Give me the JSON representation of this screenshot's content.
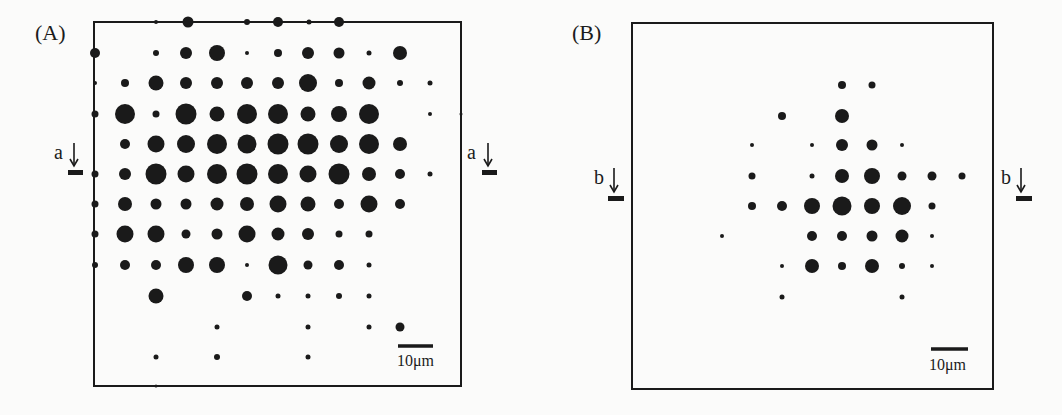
{
  "colors": {
    "ink": "#1a1a1a",
    "background": "#fbfbfa"
  },
  "panels": [
    {
      "id": "A",
      "label": "(A)",
      "label_pos": [
        35,
        40
      ],
      "frame": {
        "x": 94,
        "y": 22,
        "w": 367,
        "h": 364
      },
      "section_markers": [
        {
          "text": "a",
          "text_pos": [
            54,
            159
          ],
          "arrow_x": 74,
          "arrow_top": 143,
          "arrow_bottom": 166,
          "bar": [
            68,
            170,
            15,
            5
          ]
        },
        {
          "text": "a",
          "text_pos": [
            467,
            159
          ],
          "arrow_x": 488,
          "arrow_top": 143,
          "arrow_bottom": 166,
          "bar": [
            482,
            170,
            15,
            5
          ]
        }
      ],
      "scale_bar": {
        "x1": 398,
        "x2": 433,
        "y": 346,
        "label": "10μm",
        "label_pos": [
          397,
          366
        ]
      },
      "dots": [
        [
          156,
          22,
          2
        ],
        [
          188,
          22,
          5.5
        ],
        [
          247,
          22,
          3
        ],
        [
          278,
          22,
          5
        ],
        [
          309,
          22,
          2.5
        ],
        [
          339,
          22,
          5
        ],
        [
          95,
          53,
          5
        ],
        [
          156,
          53,
          3
        ],
        [
          186,
          53,
          6
        ],
        [
          217,
          53,
          8
        ],
        [
          247,
          53,
          2
        ],
        [
          278,
          53,
          4
        ],
        [
          308,
          53,
          6
        ],
        [
          339,
          53,
          5.5
        ],
        [
          369,
          53,
          2.5
        ],
        [
          400,
          53,
          7
        ],
        [
          95,
          83,
          2
        ],
        [
          125,
          83,
          4
        ],
        [
          156,
          83,
          7.5
        ],
        [
          186,
          83,
          6
        ],
        [
          217,
          83,
          6
        ],
        [
          247,
          83,
          6
        ],
        [
          278,
          83,
          6
        ],
        [
          308,
          83,
          9
        ],
        [
          339,
          83,
          4
        ],
        [
          369,
          83,
          6.5
        ],
        [
          400,
          83,
          3
        ],
        [
          430,
          83,
          2.5
        ],
        [
          95,
          114,
          3.5
        ],
        [
          125,
          114,
          10
        ],
        [
          156,
          114,
          3.5
        ],
        [
          186,
          114,
          10.5
        ],
        [
          217,
          114,
          7.5
        ],
        [
          247,
          114,
          10
        ],
        [
          278,
          114,
          10
        ],
        [
          308,
          114,
          7.5
        ],
        [
          339,
          114,
          8
        ],
        [
          369,
          114,
          10
        ],
        [
          430,
          114,
          2
        ],
        [
          461,
          114,
          1.5
        ],
        [
          125,
          144,
          5
        ],
        [
          156,
          144,
          8.5
        ],
        [
          186,
          144,
          9
        ],
        [
          217,
          144,
          10
        ],
        [
          247,
          144,
          9.5
        ],
        [
          278,
          144,
          10.5
        ],
        [
          308,
          144,
          10.5
        ],
        [
          339,
          144,
          9
        ],
        [
          369,
          144,
          10
        ],
        [
          400,
          144,
          7
        ],
        [
          95,
          174,
          3.5
        ],
        [
          125,
          174,
          6
        ],
        [
          156,
          174,
          10.5
        ],
        [
          186,
          174,
          8.5
        ],
        [
          217,
          174,
          10
        ],
        [
          247,
          174,
          10.5
        ],
        [
          278,
          174,
          10
        ],
        [
          308,
          174,
          8.5
        ],
        [
          339,
          174,
          10.5
        ],
        [
          369,
          174,
          7
        ],
        [
          400,
          174,
          5
        ],
        [
          430,
          174,
          2.5
        ],
        [
          95,
          204,
          3.5
        ],
        [
          125,
          204,
          7
        ],
        [
          156,
          204,
          5.5
        ],
        [
          186,
          204,
          5.5
        ],
        [
          217,
          204,
          6.5
        ],
        [
          247,
          204,
          7
        ],
        [
          278,
          204,
          8.5
        ],
        [
          308,
          204,
          7.5
        ],
        [
          339,
          204,
          5
        ],
        [
          369,
          204,
          8.5
        ],
        [
          400,
          204,
          5
        ],
        [
          95,
          234,
          3.5
        ],
        [
          125,
          234,
          8.5
        ],
        [
          156,
          234,
          8.5
        ],
        [
          186,
          234,
          4.5
        ],
        [
          217,
          234,
          5.5
        ],
        [
          247,
          234,
          8.5
        ],
        [
          278,
          234,
          6.5
        ],
        [
          308,
          234,
          6
        ],
        [
          339,
          234,
          3.5
        ],
        [
          369,
          234,
          3.5
        ],
        [
          95,
          265,
          3
        ],
        [
          125,
          265,
          5
        ],
        [
          156,
          265,
          5
        ],
        [
          186,
          265,
          8
        ],
        [
          217,
          265,
          8
        ],
        [
          247,
          265,
          2
        ],
        [
          278,
          265,
          9.5
        ],
        [
          308,
          265,
          4.5
        ],
        [
          339,
          265,
          5
        ],
        [
          369,
          265,
          2.5
        ],
        [
          156,
          296,
          7.5
        ],
        [
          247,
          296,
          5
        ],
        [
          278,
          296,
          2.5
        ],
        [
          308,
          296,
          2.5
        ],
        [
          339,
          296,
          3
        ],
        [
          369,
          296,
          2.5
        ],
        [
          217,
          327,
          2.5
        ],
        [
          308,
          327,
          2.5
        ],
        [
          369,
          327,
          2.5
        ],
        [
          400,
          327,
          4.5
        ],
        [
          156,
          357,
          2.5
        ],
        [
          217,
          357,
          3
        ],
        [
          308,
          357,
          2.5
        ],
        [
          156,
          386,
          1.5
        ]
      ]
    },
    {
      "id": "B",
      "label": "(B)",
      "label_pos": [
        572,
        40
      ],
      "frame": {
        "x": 632,
        "y": 23,
        "w": 361,
        "h": 366
      },
      "section_markers": [
        {
          "text": "b",
          "text_pos": [
            594,
            184
          ],
          "arrow_x": 614,
          "arrow_top": 168,
          "arrow_bottom": 192,
          "bar": [
            608,
            196,
            16,
            5
          ]
        },
        {
          "text": "b",
          "text_pos": [
            1001,
            184
          ],
          "arrow_x": 1021,
          "arrow_top": 168,
          "arrow_bottom": 192,
          "bar": [
            1016,
            196,
            16,
            5
          ]
        }
      ],
      "scale_bar": {
        "x1": 931,
        "x2": 968,
        "y": 349,
        "label": "10μm",
        "label_pos": [
          929,
          370
        ]
      },
      "dots": [
        [
          842,
          85,
          4
        ],
        [
          872,
          85,
          3.5
        ],
        [
          782,
          116,
          4
        ],
        [
          842,
          116,
          7
        ],
        [
          752,
          145,
          2
        ],
        [
          812,
          145,
          2
        ],
        [
          842,
          145,
          6
        ],
        [
          872,
          145,
          5.5
        ],
        [
          902,
          145,
          2
        ],
        [
          752,
          176,
          3.5
        ],
        [
          812,
          176,
          2.5
        ],
        [
          842,
          176,
          7
        ],
        [
          872,
          176,
          8
        ],
        [
          902,
          176,
          4.5
        ],
        [
          932,
          176,
          4.5
        ],
        [
          962,
          176,
          3.5
        ],
        [
          752,
          206,
          4
        ],
        [
          782,
          206,
          5
        ],
        [
          812,
          206,
          8
        ],
        [
          842,
          206,
          9.5
        ],
        [
          872,
          206,
          8
        ],
        [
          902,
          206,
          9
        ],
        [
          932,
          206,
          3.5
        ],
        [
          722,
          236,
          2
        ],
        [
          812,
          236,
          5
        ],
        [
          842,
          236,
          5
        ],
        [
          872,
          236,
          5.5
        ],
        [
          902,
          236,
          6.5
        ],
        [
          932,
          236,
          2
        ],
        [
          782,
          266,
          2
        ],
        [
          812,
          266,
          7
        ],
        [
          842,
          266,
          4
        ],
        [
          872,
          266,
          7
        ],
        [
          902,
          266,
          3
        ],
        [
          932,
          266,
          2
        ],
        [
          782,
          297,
          2.5
        ],
        [
          902,
          297,
          2.5
        ]
      ]
    }
  ]
}
